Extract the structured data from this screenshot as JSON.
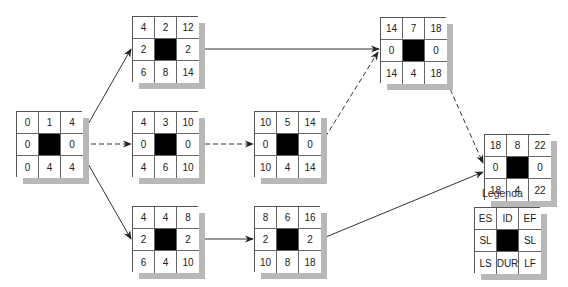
{
  "nodes": [
    {
      "id": "n1",
      "es": "0",
      "id_val": "1",
      "ef": "4",
      "sl_left": "0",
      "sl_right": "0",
      "ls": "0",
      "dur": "4",
      "lf": "4"
    },
    {
      "id": "n2",
      "es": "4",
      "id_val": "2",
      "ef": "12",
      "sl_left": "2",
      "sl_right": "2",
      "ls": "6",
      "dur": "8",
      "lf": "14"
    },
    {
      "id": "n3",
      "es": "4",
      "id_val": "3",
      "ef": "10",
      "sl_left": "0",
      "sl_right": "0",
      "ls": "4",
      "dur": "6",
      "lf": "10"
    },
    {
      "id": "n4",
      "es": "4",
      "id_val": "4",
      "ef": "8",
      "sl_left": "2",
      "sl_right": "2",
      "ls": "6",
      "dur": "4",
      "lf": "10"
    },
    {
      "id": "n5",
      "es": "10",
      "id_val": "5",
      "ef": "14",
      "sl_left": "0",
      "sl_right": "0",
      "ls": "10",
      "dur": "4",
      "lf": "14"
    },
    {
      "id": "n6",
      "es": "8",
      "id_val": "6",
      "ef": "16",
      "sl_left": "2",
      "sl_right": "2",
      "ls": "10",
      "dur": "8",
      "lf": "18"
    },
    {
      "id": "n7",
      "es": "14",
      "id_val": "7",
      "ef": "18",
      "sl_left": "0",
      "sl_right": "0",
      "ls": "14",
      "dur": "4",
      "lf": "18"
    },
    {
      "id": "n8",
      "es": "18",
      "id_val": "8",
      "ef": "22",
      "sl_left": "0",
      "sl_right": "0",
      "ls": "18",
      "dur": "4",
      "lf": "22"
    }
  ],
  "edges": [
    {
      "from": "n1",
      "to": "n2",
      "style": "solid"
    },
    {
      "from": "n1",
      "to": "n3",
      "style": "dashed"
    },
    {
      "from": "n1",
      "to": "n4",
      "style": "solid"
    },
    {
      "from": "n2",
      "to": "n7",
      "style": "solid"
    },
    {
      "from": "n3",
      "to": "n5",
      "style": "dashed"
    },
    {
      "from": "n4",
      "to": "n6",
      "style": "solid"
    },
    {
      "from": "n5",
      "to": "n7",
      "style": "dashed"
    },
    {
      "from": "n6",
      "to": "n8",
      "style": "solid"
    },
    {
      "from": "n7",
      "to": "n8",
      "style": "dashed"
    }
  ],
  "legend": {
    "title": "Legenda",
    "es": "ES",
    "id_val": "ID",
    "ef": "EF",
    "sl_left": "SL",
    "sl_right": "SL",
    "ls": "LS",
    "dur": "DUR",
    "lf": "LF"
  },
  "colors": {
    "line": "#333333",
    "shadow": "#b8b8b8",
    "center": "#000000"
  }
}
